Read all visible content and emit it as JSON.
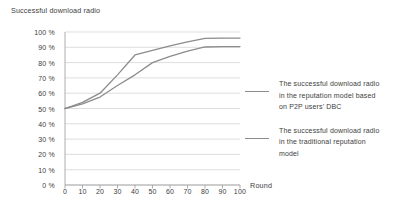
{
  "chart_data": {
    "type": "line",
    "title": "Successful download radio",
    "xlabel": "Round",
    "ylabel": "",
    "xlim": [
      0,
      100
    ],
    "ylim": [
      0,
      100
    ],
    "grid": true,
    "legend_position": "right",
    "x": [
      0,
      10,
      20,
      30,
      40,
      50,
      60,
      70,
      80,
      90,
      100
    ],
    "x_tick_labels": [
      "0",
      "10",
      "20",
      "30",
      "40",
      "50",
      "60",
      "70",
      "80",
      "90",
      "100"
    ],
    "y_tick_labels": [
      "100 %",
      "90 %",
      "80 %",
      "70 %",
      "60 %",
      "50 %",
      "40 %",
      "30 %",
      "20 %",
      "10 %",
      "0 %"
    ],
    "y_tick_values": [
      100,
      90,
      80,
      70,
      60,
      50,
      40,
      30,
      20,
      10,
      0
    ],
    "series": [
      {
        "name": "The successful download radio in the reputation model based on P2P users' DBC",
        "color": "#8c8c8c",
        "values": [
          50,
          54,
          60,
          72,
          85,
          88,
          91,
          93.5,
          95.8,
          96,
          96
        ]
      },
      {
        "name": "The  successful download radio in the traditional reputation model",
        "color": "#8c8c8c",
        "values": [
          50,
          53,
          57.5,
          65,
          72,
          80,
          84,
          87.5,
          90.2,
          90.5,
          90.5
        ]
      }
    ]
  },
  "legend": {
    "entries": [
      {
        "label": "The successful download radio in the reputation model based on P2P users' DBC",
        "line1": "The successful download radio",
        "line2": "in the reputation model based",
        "line3": "on P2P users' DBC"
      },
      {
        "label": "The  successful download radio in the traditional reputation model",
        "line1": "The  successful download radio",
        "line2": "in the traditional reputation",
        "line3": "model"
      }
    ]
  },
  "colors": {
    "line": "#8c8c8c",
    "grid": "#d0d0d0",
    "axis": "#9a9a9a",
    "text": "#3d3d3d",
    "background": "#ffffff"
  }
}
